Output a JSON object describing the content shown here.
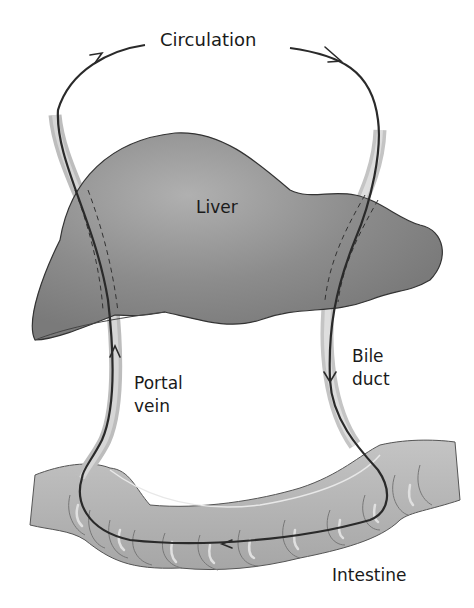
{
  "diagram": {
    "labels": {
      "circulation": "Circulation",
      "liver": "Liver",
      "portal_vein_line1": "Portal",
      "portal_vein_line2": "vein",
      "bile_duct_line1": "Bile",
      "bile_duct_line2": "duct",
      "intestine": "Intestine"
    },
    "colors": {
      "liver_fill": "#8a8a8a",
      "liver_highlight": "#a8a8a8",
      "vessel_fill": "#c8c8c8",
      "intestine_fill": "#b4b4b4",
      "flow_line": "#2a2a2a"
    },
    "flow": [
      "Circulation",
      "Bile duct",
      "Intestine",
      "Portal vein",
      "Liver"
    ]
  }
}
